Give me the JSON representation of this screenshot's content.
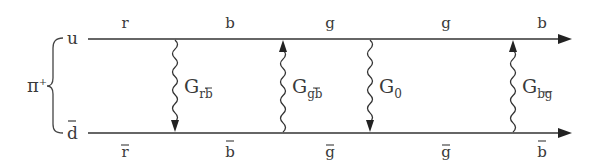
{
  "diagram": {
    "meson_label": "π",
    "meson_charge": "+",
    "quark_top": {
      "label": "u",
      "y": 39
    },
    "quark_bottom": {
      "label": "d",
      "bar": true,
      "y": 133
    },
    "line_x_start": 88,
    "line_x_end": 570,
    "top_colors": [
      {
        "label": "r",
        "x": 125
      },
      {
        "label": "b",
        "x": 230
      },
      {
        "label": "g",
        "x": 330
      },
      {
        "label": "g",
        "x": 446
      },
      {
        "label": "b",
        "x": 542
      }
    ],
    "bottom_colors": [
      {
        "label": "r",
        "bar": true,
        "x": 125
      },
      {
        "label": "b",
        "bar": true,
        "x": 230
      },
      {
        "label": "g",
        "bar": true,
        "x": 330
      },
      {
        "label": "g",
        "bar": true,
        "x": 446
      },
      {
        "label": "b",
        "bar": true,
        "x": 542
      }
    ],
    "gluons": [
      {
        "name": "G",
        "sub": "rb̄",
        "sub_main": "r",
        "sub_bar": "b",
        "x": 175,
        "direction": "down"
      },
      {
        "name": "G",
        "sub": "gb̄",
        "sub_main": "g",
        "sub_bar": "b",
        "x": 283,
        "direction": "up"
      },
      {
        "name": "G",
        "sub": "0",
        "sub_main": "0",
        "sub_bar": "",
        "x": 370,
        "direction": "down"
      },
      {
        "name": "G",
        "sub": "bḡ",
        "sub_main": "b",
        "sub_bar": "g",
        "x": 513,
        "direction": "up"
      }
    ],
    "colors": {
      "line": "#333333",
      "text": "#3a3a3a",
      "background": "#ffffff"
    }
  }
}
